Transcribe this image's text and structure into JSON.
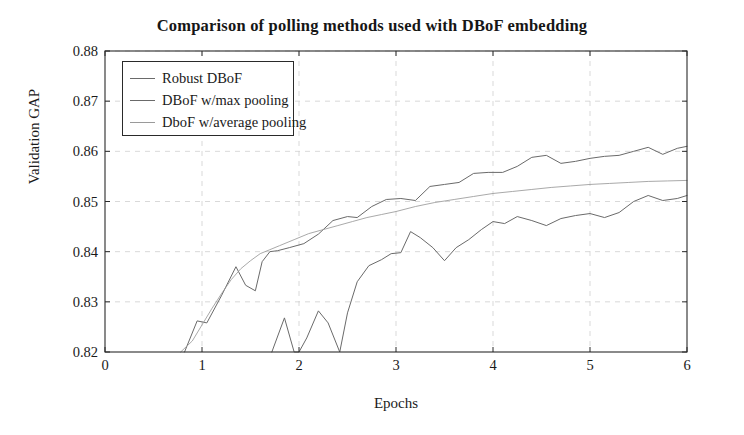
{
  "chart_data": {
    "type": "line",
    "title": "Comparison of polling methods used with DBoF embedding",
    "xlabel": "Epochs",
    "ylabel": "Validation GAP",
    "xlim": [
      0,
      6
    ],
    "ylim": [
      0.82,
      0.88
    ],
    "xticks": [
      "0",
      "1",
      "2",
      "3",
      "4",
      "5",
      "6"
    ],
    "xtick_values": [
      0,
      1,
      2,
      3,
      4,
      5,
      6
    ],
    "yticks": [
      "0.82",
      "0.83",
      "0.84",
      "0.85",
      "0.86",
      "0.87",
      "0.88"
    ],
    "ytick_values": [
      0.82,
      0.83,
      0.84,
      0.85,
      0.86,
      0.87,
      0.88
    ],
    "grid": true,
    "grid_style": "dashed",
    "legend_position": "upper-left",
    "line_color": "#6a6a6a",
    "axis_color": "#2a2a2a",
    "grid_color": "#cfcfcf",
    "series": [
      {
        "name": "Robust DBoF",
        "color": "#6a6a6a",
        "x": [
          0.82,
          0.95,
          1.05,
          1.2,
          1.35,
          1.45,
          1.55,
          1.62,
          1.7,
          1.78,
          1.9,
          2.05,
          2.2,
          2.35,
          2.5,
          2.6,
          2.75,
          2.9,
          3.05,
          3.2,
          3.35,
          3.5,
          3.65,
          3.8,
          3.95,
          4.1,
          4.25,
          4.4,
          4.55,
          4.7,
          4.85,
          5.0,
          5.15,
          5.3,
          5.45,
          5.6,
          5.75,
          5.9,
          6.0
        ],
        "y": [
          0.82,
          0.8262,
          0.8258,
          0.8312,
          0.837,
          0.8333,
          0.8322,
          0.838,
          0.84,
          0.8402,
          0.8408,
          0.8416,
          0.8435,
          0.8462,
          0.847,
          0.8468,
          0.849,
          0.8504,
          0.8506,
          0.8502,
          0.853,
          0.8534,
          0.8538,
          0.8556,
          0.8558,
          0.8558,
          0.857,
          0.8588,
          0.8592,
          0.8576,
          0.858,
          0.8586,
          0.859,
          0.8592,
          0.86,
          0.8608,
          0.8594,
          0.8606,
          0.861
        ]
      },
      {
        "name": "DBoF w/max pooling",
        "color": "#6a6a6a",
        "x": [
          1.72,
          1.85,
          1.95,
          2.0,
          2.08,
          2.2,
          2.3,
          2.42,
          2.5,
          2.6,
          2.72,
          2.85,
          2.95,
          3.05,
          3.15,
          3.25,
          3.38,
          3.5,
          3.62,
          3.75,
          3.88,
          4.0,
          4.12,
          4.25,
          4.4,
          4.55,
          4.7,
          4.85,
          5.0,
          5.15,
          5.3,
          5.45,
          5.6,
          5.75,
          5.9,
          6.0
        ],
        "y": [
          0.82,
          0.8268,
          0.82,
          0.82,
          0.8228,
          0.8282,
          0.8258,
          0.82,
          0.8278,
          0.834,
          0.8372,
          0.8384,
          0.8396,
          0.8398,
          0.844,
          0.8428,
          0.8408,
          0.8382,
          0.8408,
          0.8424,
          0.8444,
          0.846,
          0.8456,
          0.847,
          0.8462,
          0.8452,
          0.8466,
          0.8472,
          0.8476,
          0.8468,
          0.8478,
          0.85,
          0.8512,
          0.8502,
          0.8506,
          0.8512
        ]
      },
      {
        "name": "DboF w/average pooling",
        "color": "#9a9a9a",
        "x": [
          0.78,
          0.9,
          1.0,
          1.1,
          1.2,
          1.3,
          1.4,
          1.5,
          1.6,
          1.7,
          1.8,
          1.95,
          2.1,
          2.25,
          2.4,
          2.55,
          2.7,
          2.85,
          3.0,
          3.2,
          3.4,
          3.6,
          3.8,
          4.0,
          4.2,
          4.4,
          4.6,
          4.8,
          5.0,
          5.2,
          5.4,
          5.6,
          5.8,
          6.0
        ],
        "y": [
          0.82,
          0.8222,
          0.8254,
          0.8286,
          0.8316,
          0.8344,
          0.8366,
          0.8382,
          0.8396,
          0.8404,
          0.8412,
          0.8424,
          0.8436,
          0.8444,
          0.8452,
          0.846,
          0.8468,
          0.8474,
          0.848,
          0.849,
          0.8498,
          0.8504,
          0.851,
          0.8516,
          0.852,
          0.8524,
          0.8528,
          0.8531,
          0.8534,
          0.8536,
          0.8538,
          0.854,
          0.8541,
          0.8542
        ]
      }
    ]
  },
  "legend": {
    "entries": [
      {
        "label": "Robust DBoF"
      },
      {
        "label": "DBoF w/max pooling"
      },
      {
        "label": "DboF w/average pooling"
      }
    ]
  }
}
